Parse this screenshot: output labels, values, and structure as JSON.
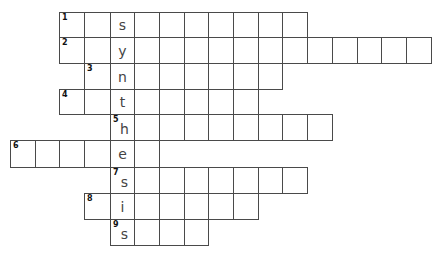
{
  "puzzle": {
    "title": "",
    "highlight_column_word": "synthesis",
    "colors": {
      "border": "#4a4a4a",
      "letter": "#444444",
      "number": "#111111",
      "background": "#ffffff"
    },
    "rows": [
      {
        "number": "1",
        "letter": "s",
        "start_col": 2,
        "length": 10
      },
      {
        "number": "2",
        "letter": "y",
        "start_col": 2,
        "length": 15
      },
      {
        "number": "3",
        "letter": "n",
        "start_col": 3,
        "length": 8
      },
      {
        "number": "4",
        "letter": "t",
        "start_col": 2,
        "length": 8
      },
      {
        "number": "5",
        "letter": "h",
        "start_col": 4,
        "length": 9
      },
      {
        "number": "6",
        "letter": "e",
        "start_col": 0,
        "length": 6
      },
      {
        "number": "7",
        "letter": "s",
        "start_col": 4,
        "length": 8
      },
      {
        "number": "8",
        "letter": "i",
        "start_col": 3,
        "length": 7
      },
      {
        "number": "9",
        "letter": "s",
        "start_col": 4,
        "length": 4
      }
    ]
  }
}
